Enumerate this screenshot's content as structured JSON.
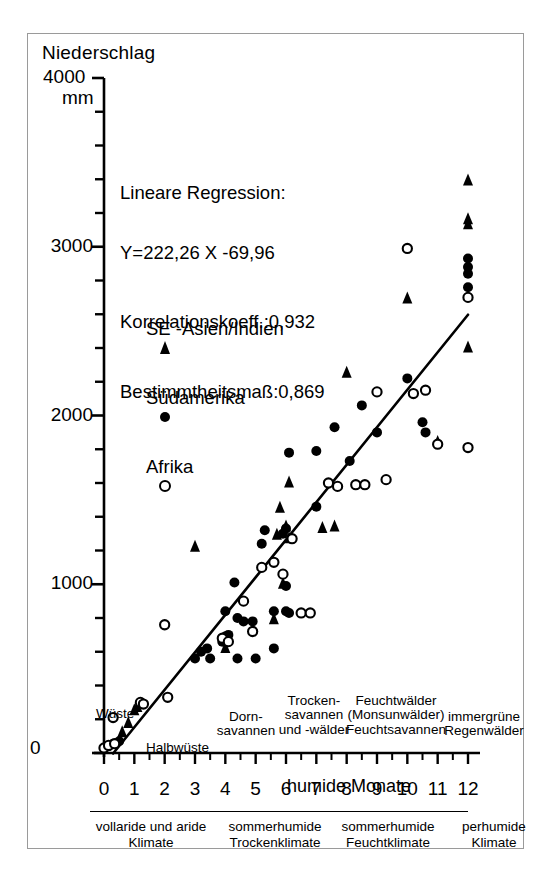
{
  "figure": {
    "y_axis_title": "Niederschlag",
    "y_max_label": "4000",
    "y_unit": "mm",
    "x_axis_title": "humide Monate"
  },
  "annotation": {
    "line1": "Lineare Regression:",
    "line2": "Y=222,26 X -69,96",
    "line3": "Korrelationskoeff.:0,932",
    "line4": "Bestimmtheitsmaß:0,869"
  },
  "legend": {
    "entries": [
      {
        "symbol": "triangle",
        "label": "SE -Asien/Indien"
      },
      {
        "symbol": "filled-circle",
        "label": "Südamerika"
      },
      {
        "symbol": "open-circle",
        "label": "Afrika"
      }
    ]
  },
  "y_ticks": [
    "1000",
    "2000",
    "3000"
  ],
  "x_ticks": [
    "0",
    "1",
    "2",
    "3",
    "4",
    "5",
    "6",
    "7",
    "8",
    "9",
    "10",
    "11",
    "12"
  ],
  "zero_label": "0",
  "vegetation_zones": [
    {
      "name": "wueste",
      "lines": "Wüste"
    },
    {
      "name": "halbwueste",
      "lines": "Halbwüste"
    },
    {
      "name": "dornsavannen",
      "lines": "Dorn-\nsavannen"
    },
    {
      "name": "trockensavannen",
      "lines": "Trocken-\nsavannen\nund -wälder"
    },
    {
      "name": "feuchtwaelder",
      "lines": "Feuchtwälder\n(Monsunwälder)\nFeuchtsavannen"
    },
    {
      "name": "regenwaelder",
      "lines": "immergrüne\nRegenwälder"
    }
  ],
  "climate_zones": [
    {
      "name": "vollaride-aride",
      "lines": "vollaride und aride\nKlimate"
    },
    {
      "name": "sommerhumide-trocken",
      "lines": "sommerhumide\nTrockenklimate"
    },
    {
      "name": "sommerhumide-feucht",
      "lines": "sommerhumide\nFeuchtklimate"
    },
    {
      "name": "perhumide",
      "lines": "perhumide\nKlimate"
    }
  ],
  "colors": {
    "ink": "#000000",
    "frame": "#9a9a9a",
    "background": "#ffffff"
  },
  "chart_data": {
    "type": "scatter",
    "title": "",
    "xlabel": "humide Monate",
    "ylabel": "Niederschlag (mm)",
    "xlim": [
      0,
      12
    ],
    "ylim": [
      0,
      4000
    ],
    "grid": false,
    "legend_position": "upper-left-inside",
    "y_major_tick_step": 1000,
    "y_minor_tick_step": 200,
    "x_tick_step": 1,
    "regression": {
      "equation": "Y = 222,26 X - 69,96",
      "slope": 222.26,
      "intercept": -69.96,
      "correlation_coefficient": 0.932,
      "coefficient_of_determination": 0.869,
      "x_from": 0.3,
      "x_to": 12.0
    },
    "series": [
      {
        "name": "SE -Asien/Indien",
        "marker": "triangle",
        "fill": "#000000",
        "points": [
          [
            0.6,
            120
          ],
          [
            0.8,
            175
          ],
          [
            1.0,
            250
          ],
          [
            1.1,
            270
          ],
          [
            3.0,
            1220
          ],
          [
            4.0,
            620
          ],
          [
            5.6,
            790
          ],
          [
            5.9,
            1000
          ],
          [
            5.8,
            1450
          ],
          [
            6.1,
            1600
          ],
          [
            5.7,
            1290
          ],
          [
            5.9,
            1310
          ],
          [
            6.0,
            1340
          ],
          [
            6.1,
            1270
          ],
          [
            7.2,
            1330
          ],
          [
            7.6,
            1340
          ],
          [
            8.0,
            2250
          ],
          [
            10.0,
            2690
          ],
          [
            11.0,
            1840
          ],
          [
            12.0,
            3390
          ],
          [
            12.0,
            3160
          ],
          [
            12.0,
            3130
          ],
          [
            12.0,
            2400
          ]
        ]
      },
      {
        "name": "Südamerika",
        "marker": "filled-circle",
        "fill": "#000000",
        "points": [
          [
            0.15,
            40
          ],
          [
            0.3,
            55
          ],
          [
            0.5,
            70
          ],
          [
            3.0,
            560
          ],
          [
            3.2,
            600
          ],
          [
            3.4,
            620
          ],
          [
            3.5,
            560
          ],
          [
            3.9,
            660
          ],
          [
            4.0,
            690
          ],
          [
            4.1,
            700
          ],
          [
            4.4,
            560
          ],
          [
            4.0,
            840
          ],
          [
            4.4,
            800
          ],
          [
            4.6,
            780
          ],
          [
            4.9,
            780
          ],
          [
            5.0,
            560
          ],
          [
            4.3,
            1010
          ],
          [
            5.2,
            1240
          ],
          [
            5.3,
            1320
          ],
          [
            5.9,
            1300
          ],
          [
            6.0,
            1330
          ],
          [
            6.0,
            840
          ],
          [
            6.1,
            830
          ],
          [
            6.0,
            990
          ],
          [
            5.6,
            840
          ],
          [
            5.6,
            620
          ],
          [
            6.1,
            1780
          ],
          [
            7.0,
            1790
          ],
          [
            7.0,
            1460
          ],
          [
            7.6,
            1930
          ],
          [
            8.1,
            1730
          ],
          [
            8.5,
            2060
          ],
          [
            9.0,
            1900
          ],
          [
            10.0,
            2220
          ],
          [
            10.5,
            1960
          ],
          [
            10.6,
            1900
          ],
          [
            12.0,
            2930
          ],
          [
            12.0,
            2880
          ],
          [
            12.0,
            2840
          ],
          [
            12.0,
            2760
          ]
        ]
      },
      {
        "name": "Afrika",
        "marker": "open-circle",
        "fill": "#ffffff",
        "points": [
          [
            0.0,
            30
          ],
          [
            0.15,
            45
          ],
          [
            0.35,
            55
          ],
          [
            0.3,
            210
          ],
          [
            1.2,
            300
          ],
          [
            1.3,
            290
          ],
          [
            2.0,
            760
          ],
          [
            2.1,
            330
          ],
          [
            3.9,
            680
          ],
          [
            4.1,
            660
          ],
          [
            4.6,
            900
          ],
          [
            4.9,
            720
          ],
          [
            5.2,
            1100
          ],
          [
            5.6,
            1130
          ],
          [
            5.9,
            1060
          ],
          [
            6.2,
            1270
          ],
          [
            6.5,
            830
          ],
          [
            6.8,
            830
          ],
          [
            7.4,
            1600
          ],
          [
            7.7,
            1580
          ],
          [
            8.3,
            1590
          ],
          [
            8.6,
            1590
          ],
          [
            9.0,
            2140
          ],
          [
            9.3,
            1620
          ],
          [
            10.0,
            2990
          ],
          [
            10.2,
            2130
          ],
          [
            10.6,
            2150
          ],
          [
            11.0,
            1830
          ],
          [
            12.0,
            2700
          ],
          [
            12.0,
            1810
          ]
        ]
      }
    ]
  }
}
